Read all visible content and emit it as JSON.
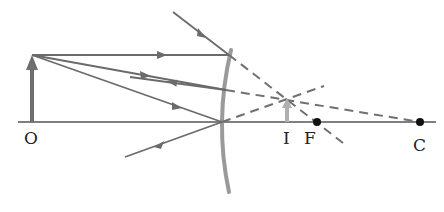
{
  "diagram": {
    "labels": {
      "object": "O",
      "image": "I",
      "focus": "F",
      "center": "C"
    },
    "colors": {
      "ray": "#6b6b6b",
      "axis": "#555555",
      "mirror": "#9a9a9a",
      "object_arrow": "#6e6e6e",
      "image_arrow": "#b0b0b0",
      "point": "#111111"
    }
  }
}
